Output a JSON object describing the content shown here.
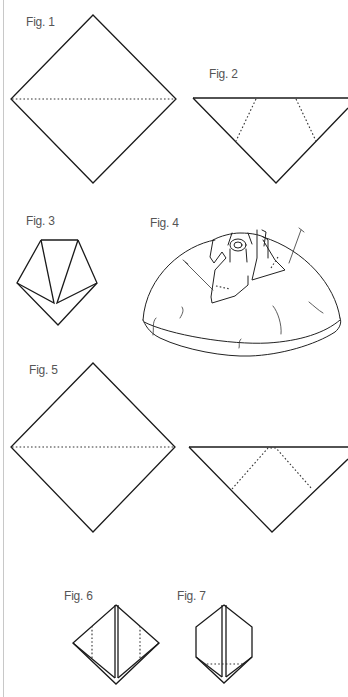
{
  "figures": [
    {
      "id": "fig1",
      "label": "Fig. 1",
      "description": "Square diamond with dotted horizontal fold line across the middle"
    },
    {
      "id": "fig2",
      "label": "Fig. 2",
      "description": "Downward triangle with two dotted diagonal fold lines"
    },
    {
      "id": "fig3",
      "label": "Fig. 3",
      "description": "Pentagon shape with two folded flaps meeting at center"
    },
    {
      "id": "fig4",
      "label": "Fig. 4",
      "description": "Sketch of dome-shaped fabric with folded rose in center and two pins"
    },
    {
      "id": "fig5",
      "label": "Fig. 5",
      "description": "Square diamond with dotted horizontal fold line"
    },
    {
      "id": "fig5b",
      "label": "",
      "description": "Downward triangle with inverted-V dotted fold lines"
    },
    {
      "id": "fig6",
      "label": "Fig. 6",
      "description": "Diamond with center double line and two vertical dotted fold lines"
    },
    {
      "id": "fig7",
      "label": "Fig. 7",
      "description": "Hexagon with center double line and horizontal dotted fold line at bottom"
    }
  ],
  "colors": {
    "line": "#1a1a1a",
    "label": "#555555",
    "background": "#ffffff",
    "border": "#c8c8c8"
  }
}
